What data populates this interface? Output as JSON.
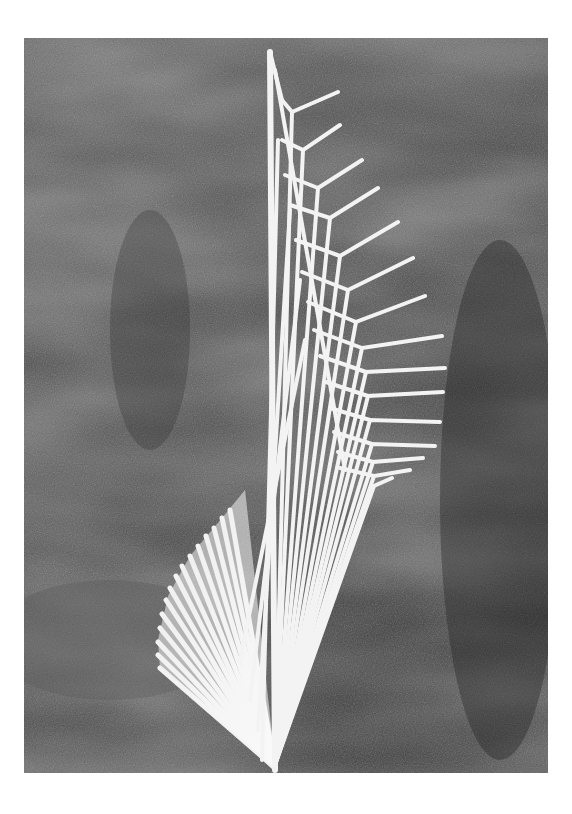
{
  "image": {
    "subject": "white stick sculpture with fanning ribs and angled arms",
    "background": "dark draped cloth",
    "border_color": "#ffffff",
    "background_color": "#3a3a3a",
    "sculpture_color": "#f2f2f2",
    "frame": {
      "x": 24,
      "y": 38,
      "width": 524,
      "height": 735
    }
  }
}
